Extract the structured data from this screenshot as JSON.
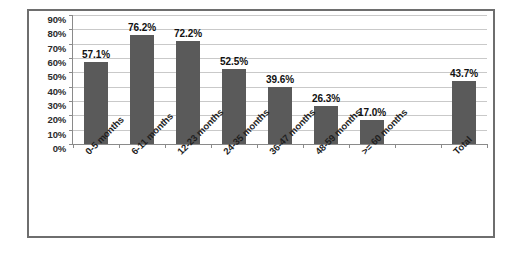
{
  "chart_data": {
    "type": "bar",
    "title": "",
    "subtitle": "",
    "xlabel": "",
    "ylabel": "",
    "categories": [
      "0-5 months",
      "6-11 months",
      "12-23 months",
      "24-35 months",
      "36-47 months",
      "48-59 months",
      ">= 60 months",
      "",
      "Total"
    ],
    "values": [
      57.1,
      76.2,
      72.2,
      52.5,
      39.6,
      26.3,
      17.0,
      null,
      43.7
    ],
    "data_labels": [
      "57.1%",
      "76.2%",
      "72.2%",
      "52.5%",
      "39.6%",
      "26.3%",
      "17.0%",
      "",
      "43.7%"
    ],
    "ylim": [
      0,
      90
    ],
    "ytick_values": [
      0,
      10,
      20,
      30,
      40,
      50,
      60,
      70,
      80,
      90
    ],
    "ytick_labels": [
      "0%",
      "10%",
      "20%",
      "30%",
      "40%",
      "50%",
      "60%",
      "70%",
      "80%",
      "90%"
    ],
    "grid": true,
    "legend": false,
    "legend_position": "none",
    "bar_color": "#5a5a5a",
    "gridline_color": "#c9c9c9",
    "axis_color": "#8a8a8a",
    "frame_color": "#6e6e6e",
    "background_color": "#ffffff"
  }
}
